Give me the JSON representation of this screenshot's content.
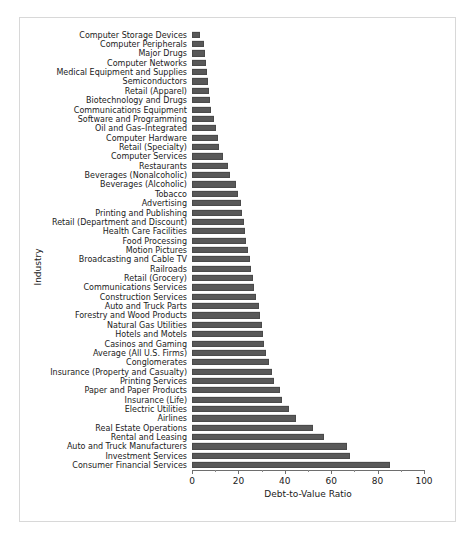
{
  "chart_data": {
    "type": "bar",
    "orientation": "horizontal",
    "title": "",
    "xlabel": "Debt-to-Value Ratio",
    "ylabel": "Industry",
    "xlim": [
      0,
      100
    ],
    "xticks": [
      0,
      20,
      40,
      60,
      80,
      100
    ],
    "xtick_labels": [
      "0",
      "20",
      "40",
      "60",
      "80",
      "100"
    ],
    "grid": false,
    "legend": null,
    "bar_color": "#595959",
    "categories": [
      "Computer Storage Devices",
      "Computer Peripherals",
      "Major Drugs",
      "Computer Networks",
      "Medical Equipment and Supplies",
      "Semiconductors",
      "Retail (Apparel)",
      "Biotechnology and Drugs",
      "Communications Equipment",
      "Software and Programming",
      "Oil and Gas–Integrated",
      "Computer Hardware",
      "Retail (Specialty)",
      "Computer Services",
      "Restaurants",
      "Beverages (Nonalcoholic)",
      "Beverages (Alcoholic)",
      "Tobacco",
      "Advertising",
      "Printing and Publishing",
      "Retail (Department and Discount)",
      "Health Care Facilities",
      "Food Processing",
      "Motion Pictures",
      "Broadcasting and Cable TV",
      "Railroads",
      "Retail (Grocery)",
      "Communications Services",
      "Construction Services",
      "Auto and Truck Parts",
      "Forestry and Wood Products",
      "Natural Gas Utilities",
      "Hotels and Motels",
      "Casinos and Gaming",
      "Average (All U.S. Firms)",
      "Conglomerates",
      "Insurance (Property and Casualty)",
      "Printing Services",
      "Paper and Paper Products",
      "Insurance (Life)",
      "Electric Utilities",
      "Airlines",
      "Real Estate Operations",
      "Rental and Leasing",
      "Auto and Truck Manufacturers",
      "Investment Services",
      "Consumer Financial Services"
    ],
    "values": [
      3.4,
      5.2,
      5.8,
      6.2,
      6.6,
      7.0,
      7.4,
      7.8,
      8.2,
      9.6,
      10.2,
      11.0,
      11.6,
      13.4,
      15.4,
      16.4,
      19.0,
      20.0,
      21.0,
      21.6,
      22.2,
      22.8,
      23.4,
      24.2,
      25.0,
      25.6,
      26.2,
      26.8,
      27.4,
      28.8,
      29.4,
      30.0,
      30.6,
      31.2,
      31.8,
      33.0,
      34.6,
      35.2,
      38.0,
      39.0,
      42.0,
      45.0,
      52.0,
      57.0,
      67.0,
      68.0,
      85.3
    ]
  }
}
